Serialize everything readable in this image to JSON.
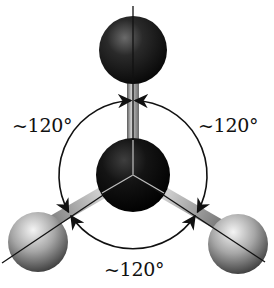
{
  "diagram": {
    "labels": {
      "angle_left": "~120°",
      "angle_right": "~120°",
      "angle_bottom": "~120°"
    },
    "atoms": [
      {
        "role": "central",
        "color": "#0d0d0d"
      },
      {
        "role": "top",
        "color": "#1a1a1a"
      },
      {
        "role": "bottom-left",
        "color": "#9a9a9a"
      },
      {
        "role": "bottom-right",
        "color": "#9a9a9a"
      }
    ],
    "colors": {
      "line": "#111111",
      "bond": "#a8a8a8",
      "background": "#ffffff"
    }
  }
}
